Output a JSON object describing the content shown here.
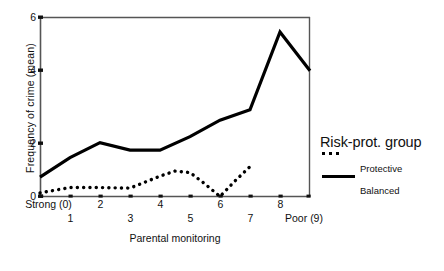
{
  "chart_data": {
    "type": "line",
    "title": "",
    "xlabel": "Parental monitoring",
    "ylabel": "Frequency of crime (mean)",
    "x": [
      0,
      1,
      2,
      3,
      4,
      5,
      6,
      7,
      8,
      9
    ],
    "xlim": [
      0,
      9
    ],
    "ylim": [
      0,
      6
    ],
    "yticks": [
      0,
      2,
      4,
      6
    ],
    "ytick_labels": [
      "0",
      "2",
      "4",
      "6"
    ],
    "xticks": [
      0,
      1,
      2,
      3,
      4,
      5,
      6,
      7,
      8,
      9
    ],
    "xtick_labels": [
      "Strong (0)",
      "1",
      "2",
      "3",
      "4",
      "5",
      "6",
      "7",
      "8",
      "Poor (9)"
    ],
    "grid": false,
    "legend_position": "right",
    "legend_title": "Risk-prot. group",
    "series": [
      {
        "name": "Protective",
        "style": "dotted",
        "x": [
          0,
          1,
          2,
          3,
          4,
          4.5,
          5,
          5.5,
          6,
          6.5,
          7
        ],
        "values": [
          0.12,
          0.3,
          0.3,
          0.28,
          0.68,
          0.85,
          0.8,
          0.42,
          0.0,
          0.52,
          1.0
        ]
      },
      {
        "name": "Balanced",
        "style": "solid",
        "x": [
          0,
          1,
          2,
          3,
          4,
          5,
          6,
          7,
          8,
          9
        ],
        "values": [
          0.65,
          1.3,
          1.8,
          1.55,
          1.55,
          2.0,
          2.55,
          2.9,
          5.5,
          4.2
        ]
      }
    ]
  },
  "axis": {
    "y_title": "Frequency of crime (mean)",
    "x_title": "Parental monitoring",
    "y_labels": [
      "6",
      "4",
      "2",
      "0"
    ],
    "x_labels_top": [
      "Strong (0)",
      "2",
      "4",
      "6",
      "8"
    ],
    "x_labels_bottom": [
      "1",
      "3",
      "5",
      "7",
      "Poor (9)"
    ]
  },
  "legend": {
    "title": "Risk-prot. group",
    "items": [
      {
        "label": "Protective",
        "style": "dotted"
      },
      {
        "label": "Balanced",
        "style": "solid"
      }
    ]
  },
  "colors": {
    "line": "#000000",
    "axis": "#555555",
    "background": "#ffffff"
  }
}
